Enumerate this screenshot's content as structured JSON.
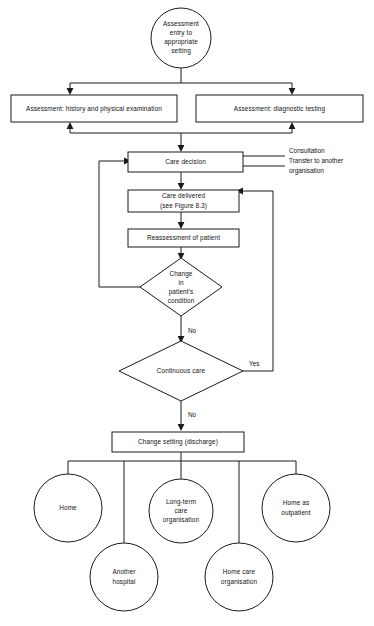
{
  "figure": {
    "type": "flowchart",
    "orientation": "top-to-bottom",
    "background_color": "#ffffff",
    "line_color": "#1a1a1a",
    "text_color": "#111111"
  },
  "nodes": {
    "entry": {
      "shape": "circle",
      "lines": [
        "Assessment",
        "entry to",
        "appropriate",
        "setting"
      ]
    },
    "assessment_history": {
      "shape": "rectangle",
      "lines": [
        "Assessment: history and physical examination"
      ]
    },
    "assessment_diagnostic": {
      "shape": "rectangle",
      "lines": [
        "Assessment: diagnostic testing"
      ]
    },
    "care_decision": {
      "shape": "rectangle",
      "lines": [
        "Care decision"
      ]
    },
    "care_delivered": {
      "shape": "rectangle",
      "lines": [
        "Care delivered",
        "(see Figure 8.3)"
      ]
    },
    "reassessment": {
      "shape": "rectangle",
      "lines": [
        "Reassessment of patient"
      ]
    },
    "change_condition": {
      "shape": "diamond",
      "lines": [
        "Change",
        "in",
        "patient's",
        "condition"
      ]
    },
    "continuous_care": {
      "shape": "diamond",
      "lines": [
        "Continuous care"
      ]
    },
    "change_setting": {
      "shape": "rectangle",
      "lines": [
        "Change setting (discharge)"
      ]
    },
    "home": {
      "shape": "circle",
      "lines": [
        "Home"
      ]
    },
    "long_term_care": {
      "shape": "circle",
      "lines": [
        "Long-term",
        "care",
        "organisation"
      ]
    },
    "home_as_outpatient": {
      "shape": "circle",
      "lines": [
        "Home as",
        "outpatient"
      ]
    },
    "another_hospital": {
      "shape": "circle",
      "lines": [
        "Another",
        "hospital"
      ]
    },
    "home_care_organisation": {
      "shape": "circle",
      "lines": [
        "Home care",
        "organisation"
      ]
    }
  },
  "edge_labels": {
    "change_condition_no": "No",
    "continuous_care_no": "No",
    "continuous_care_yes": "Yes"
  },
  "side_inputs": {
    "care_decision_sources": [
      "Consultation",
      "Transfer to another",
      "organisation"
    ]
  }
}
